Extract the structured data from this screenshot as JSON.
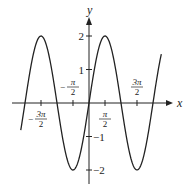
{
  "chart_data": {
    "type": "line",
    "title": "",
    "function": "y = 2 sin x",
    "xlabel": "x",
    "ylabel": "y",
    "xlim": [
      -5.2,
      5.4
    ],
    "ylim": [
      -2.4,
      2.6
    ],
    "grid": false,
    "legend": null,
    "x_ticks": [
      {
        "value": -4.712,
        "label_num": "3π",
        "label_den": "2",
        "sign": "−",
        "position": "below"
      },
      {
        "value": -1.571,
        "label_num": "π",
        "label_den": "2",
        "sign": "−",
        "position": "above"
      },
      {
        "value": 1.571,
        "label_num": "π",
        "label_den": "2",
        "sign": "",
        "position": "below"
      },
      {
        "value": 4.712,
        "label_num": "3π",
        "label_den": "2",
        "sign": "",
        "position": "above"
      }
    ],
    "y_ticks": [
      {
        "value": 2,
        "label": "2"
      },
      {
        "value": 1,
        "label": "1"
      },
      {
        "value": -1,
        "label": "−1"
      },
      {
        "value": -2,
        "label": "−2"
      }
    ],
    "series": [
      {
        "name": "2 sin x",
        "x": [
          -6.7,
          -6.283,
          -4.712,
          -3.142,
          -1.571,
          0,
          1.571,
          3.142,
          4.712,
          6.283,
          7.1
        ],
        "y": [
          -1.1,
          0,
          2,
          0,
          -2,
          0,
          2,
          0,
          -2,
          0,
          1.3
        ]
      }
    ],
    "domain": [
      -6.7,
      7.1
    ]
  }
}
